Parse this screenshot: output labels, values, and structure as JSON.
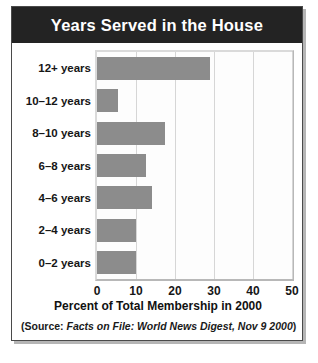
{
  "title": "Years Served in the House",
  "source": {
    "prefix": "(Source: ",
    "italic": "Facts on File: World News Digest, Nov 9 2000",
    "suffix": ")"
  },
  "colors": {
    "title_bar": "#232323",
    "title_text": "#ffffff",
    "bar_fill": "#8c8c8c",
    "plot_background": "#fdfdfd",
    "gridline": "#d6d6d6",
    "frame": "#4a4a4a"
  },
  "chart_data": {
    "type": "bar",
    "orientation": "horizontal",
    "title": "Years Served in the House",
    "xlabel": "Percent of Total Membership in 2000",
    "ylabel": "",
    "xlim": [
      0,
      50
    ],
    "xticks": [
      0,
      10,
      20,
      30,
      40,
      50
    ],
    "grid": true,
    "legend": false,
    "categories": [
      "12+ years",
      "10–12 years",
      "8–10 years",
      "6–8 years",
      "4–6 years",
      "2–4 years",
      "0–2 years"
    ],
    "values": [
      29,
      5.5,
      17.5,
      12.5,
      14,
      10,
      10
    ],
    "annotation": "(Source: Facts on File: World News Digest, Nov 9 2000)"
  }
}
